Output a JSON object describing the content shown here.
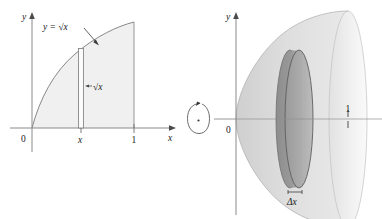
{
  "figure": {
    "background_color": "#ffffff",
    "stroke_color": "#6e6e6e",
    "text_color": "#1a1a1a"
  },
  "left_panel": {
    "name": "region-under-curve",
    "axes": {
      "y_axis_label": "y",
      "x_axis_label": "x",
      "origin_label": "0",
      "x_ticks": [
        {
          "label": "x",
          "value": 0.45
        },
        {
          "label": "1",
          "value": 1
        }
      ]
    },
    "curve": {
      "equation_label": "y = √x",
      "function": "sqrt(x)",
      "domain": [
        0,
        1
      ]
    },
    "region": {
      "fill_color": "#f0f0f0",
      "description": "region under y = √x from 0 to 1"
    },
    "strip": {
      "label": "√x",
      "x_position": 0.45,
      "description": "thin vertical rectangle of height √x"
    }
  },
  "rotation": {
    "name": "revolve-about-x-axis",
    "symbol": "circular-arrow",
    "description": "rotate region about the x-axis"
  },
  "right_panel": {
    "name": "solid-of-revolution",
    "axes": {
      "y_axis_label": "y",
      "origin_label": "0",
      "x_ticks": [
        {
          "label": "1",
          "value": 1
        }
      ]
    },
    "solid": {
      "description": "paraboloid solid generated by revolving region about x-axis",
      "body_fill": "#d8d8d8",
      "cap_fill": "#ececec"
    },
    "disk": {
      "label": "Δx",
      "fill_color": "#a8a8a8",
      "description": "representative disk of thickness Δx and radius √x"
    }
  }
}
